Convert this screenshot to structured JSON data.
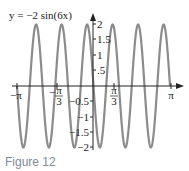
{
  "chart_data": {
    "type": "line",
    "title": "y = −2 sin(6x)",
    "xlabel": "",
    "ylabel": "",
    "xlim": [
      -3.14159,
      3.14159
    ],
    "ylim": [
      -2,
      2
    ],
    "x_ticks": [
      "−π",
      "−π/3",
      "π/3",
      "π"
    ],
    "y_ticks": [
      "2",
      "1.5",
      "1",
      ".5",
      "−0.5",
      "−1",
      "−1.5",
      "−2"
    ],
    "series": [
      {
        "name": "y = −2 sin(6x)",
        "function": "-2*sin(6x)",
        "amplitude": 2,
        "period": "π/3",
        "color": "#8a8a8a"
      }
    ],
    "grid": false,
    "legend": "none"
  },
  "caption": "Figure 12",
  "title": "y = −2 sin(6x)",
  "x_tick_labels": {
    "neg_pi": "−π",
    "neg_pi_3_num": "π",
    "neg_pi_3_den": "3",
    "pi_3_num": "π",
    "pi_3_den": "3",
    "pi": "π"
  },
  "y_tick_labels": {
    "p2": "2",
    "p15": "1.5",
    "p1": "1",
    "p05": ".5",
    "n05": "−0.5",
    "n1": "−1",
    "n15": "−1.5",
    "n2": "−2"
  }
}
